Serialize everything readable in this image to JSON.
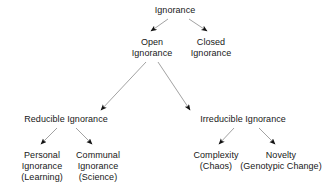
{
  "diagram": {
    "type": "tree",
    "style": {
      "background": "#ffffff",
      "text_color": "#171717",
      "edge_color": "#8a8a8a",
      "arrowhead_color": "#111111"
    },
    "nodes": {
      "root": {
        "lines": [
          "Ignorance"
        ]
      },
      "open": {
        "lines": [
          "Open",
          "Ignorance"
        ]
      },
      "closed": {
        "lines": [
          "Closed",
          "Ignorance"
        ]
      },
      "reducible": {
        "lines": [
          "Reducible Ignorance"
        ]
      },
      "irreducible": {
        "lines": [
          "Irreducible Ignorance"
        ]
      },
      "personal": {
        "lines": [
          "Personal",
          "Ignorance",
          "(Learning)"
        ]
      },
      "communal": {
        "lines": [
          "Communal",
          "Ignorance",
          "(Science)"
        ]
      },
      "complexity": {
        "lines": [
          "Complexity",
          "(Chaos)"
        ]
      },
      "novelty": {
        "lines": [
          "Novelty",
          "(Genotypic Change)"
        ]
      }
    },
    "edges": [
      {
        "from": "root",
        "to": "open"
      },
      {
        "from": "root",
        "to": "closed"
      },
      {
        "from": "open",
        "to": "reducible"
      },
      {
        "from": "open",
        "to": "irreducible"
      },
      {
        "from": "reducible",
        "to": "personal"
      },
      {
        "from": "reducible",
        "to": "communal"
      },
      {
        "from": "irreducible",
        "to": "complexity"
      },
      {
        "from": "irreducible",
        "to": "novelty"
      }
    ]
  }
}
